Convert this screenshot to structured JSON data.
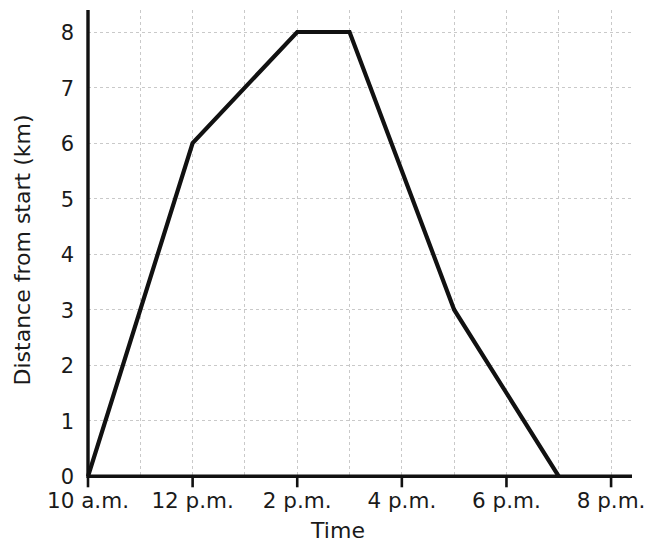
{
  "chart_data": {
    "type": "line",
    "title": "",
    "xlabel": "Time",
    "ylabel": "Distance from start (km)",
    "x_tick_labels": [
      "10 a.m.",
      "12 p.m.",
      "2 p.m.",
      "4 p.m.",
      "6 p.m.",
      "8 p.m."
    ],
    "x_tick_values": [
      10,
      12,
      14,
      16,
      18,
      20
    ],
    "y_tick_labels": [
      "0",
      "1",
      "2",
      "3",
      "4",
      "5",
      "6",
      "7",
      "8"
    ],
    "y_tick_values": [
      0,
      1,
      2,
      3,
      4,
      5,
      6,
      7,
      8
    ],
    "xlim": [
      10,
      20.4
    ],
    "ylim": [
      0,
      8.4
    ],
    "grid": true,
    "grid_x_step": 1,
    "grid_y_step": 1,
    "legend": false,
    "legend_position": "none",
    "series": [
      {
        "name": "Distance from start",
        "color": "#111111",
        "x": [
          10,
          12,
          14,
          15,
          17,
          19
        ],
        "y": [
          0,
          6,
          8,
          8,
          3,
          0
        ],
        "points": [
          {
            "time": "10 a.m.",
            "x": 10,
            "y": 0
          },
          {
            "time": "12 p.m.",
            "x": 12,
            "y": 6
          },
          {
            "time": "2 p.m.",
            "x": 14,
            "y": 8
          },
          {
            "time": "3 p.m.",
            "x": 15,
            "y": 8
          },
          {
            "time": "5 p.m.",
            "x": 17,
            "y": 3
          },
          {
            "time": "7 p.m.",
            "x": 19,
            "y": 0
          }
        ]
      }
    ],
    "colors": {
      "line": "#111111",
      "axis": "#111111",
      "grid": "#c9c9c9",
      "text": "#1a1a1a",
      "background": "#ffffff"
    }
  }
}
